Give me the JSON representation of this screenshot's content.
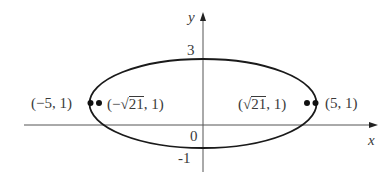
{
  "figure": {
    "type": "ellipse-diagram",
    "axes": {
      "x_label": "x",
      "y_label": "y",
      "origin_label": "0",
      "y_ticks": [
        {
          "value": 3,
          "label": "3"
        },
        {
          "value": -1,
          "label": "-1"
        }
      ]
    },
    "ellipse": {
      "center": [
        0,
        1
      ],
      "semi_major_a": 5,
      "semi_minor_b": 2
    },
    "points": [
      {
        "id": "left-vertex",
        "label_display": "(−5, 1)"
      },
      {
        "id": "left-focus",
        "label_prefix": "(−",
        "label_radicand": "21",
        "label_suffix": ", 1)"
      },
      {
        "id": "right-focus",
        "label_prefix": "(",
        "label_radicand": "21",
        "label_suffix": ", 1)"
      },
      {
        "id": "right-vertex",
        "label_display": "(5, 1)"
      }
    ],
    "colors": {
      "stroke": "#1a1a1a",
      "axis": "#555555",
      "text": "#3a3a3a",
      "background": "#ffffff"
    }
  }
}
